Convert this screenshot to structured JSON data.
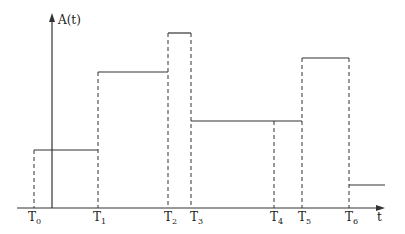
{
  "diagram": {
    "type": "step-function",
    "y_axis_label": "A(t)",
    "x_axis_label": "t",
    "time_marks": [
      {
        "base": "T",
        "sub": "0",
        "x": 34
      },
      {
        "base": "T",
        "sub": "1",
        "x": 98
      },
      {
        "base": "T",
        "sub": "2",
        "x": 168
      },
      {
        "base": "T",
        "sub": "3",
        "x": 191
      },
      {
        "base": "T",
        "sub": "4",
        "x": 274
      },
      {
        "base": "T",
        "sub": "5",
        "x": 302
      },
      {
        "base": "T",
        "sub": "6",
        "x": 349
      }
    ],
    "segments": [
      {
        "from": "T0",
        "to": "T1",
        "level_y": 150
      },
      {
        "from": "T1",
        "to": "T2",
        "level_y": 72
      },
      {
        "from": "T2",
        "to": "T3",
        "level_y": 33
      },
      {
        "from": "T3",
        "to": "T5",
        "level_y": 121
      },
      {
        "from": "T5",
        "to": "T6",
        "level_y": 58
      },
      {
        "from": "T6",
        "to": "end",
        "level_y": 185
      }
    ],
    "colors": {
      "line": "#333333",
      "background": "#ffffff"
    }
  }
}
